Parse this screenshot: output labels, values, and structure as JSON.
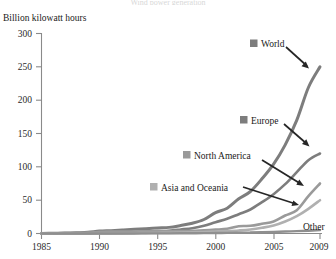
{
  "figure": {
    "cut_off_header": "Wind power generation",
    "yaxis_title": "Billion kilowatt hours"
  },
  "axes": {
    "y_ticks": [
      "0",
      "50",
      "100",
      "150",
      "200",
      "250",
      "300"
    ],
    "x_ticks": [
      "1985",
      "1990",
      "1995",
      "2000",
      "2005",
      "2009"
    ]
  },
  "annotations": [
    {
      "label": "World",
      "swatch": true,
      "color": "#7d7d7d"
    },
    {
      "label": "Europe",
      "swatch": true,
      "color": "#7d7d7d"
    },
    {
      "label": "North America",
      "swatch": true,
      "color": "#9a9a9a"
    },
    {
      "label": "Asia and Oceania",
      "swatch": true,
      "color": "#b0b0b0"
    },
    {
      "label": "Other",
      "swatch": false,
      "color": "#8f8f8f"
    }
  ],
  "chart_data": {
    "type": "line",
    "title": "Wind power generation",
    "xlabel": "",
    "ylabel": "Billion kilowatt hours",
    "xlim": [
      1985,
      2009
    ],
    "ylim": [
      0,
      300
    ],
    "grid": false,
    "legend": "annotated-labels-with-arrows",
    "x": [
      1985,
      1986,
      1987,
      1988,
      1989,
      1990,
      1991,
      1992,
      1993,
      1994,
      1995,
      1996,
      1997,
      1998,
      1999,
      2000,
      2001,
      2002,
      2003,
      2004,
      2005,
      2006,
      2007,
      2008,
      2009
    ],
    "series": [
      {
        "name": "World",
        "color": "#7d7d7d",
        "end_value": 250,
        "values": [
          0.005,
          0.3,
          0.6,
          1.1,
          1.8,
          3.6,
          4.3,
          5.2,
          6.2,
          7.3,
          8.4,
          9.2,
          12.0,
          15.4,
          21.0,
          31.4,
          38.0,
          52.0,
          63.0,
          82.0,
          104.0,
          133.0,
          170.0,
          219.0,
          250.0
        ]
      },
      {
        "name": "Europe",
        "color": "#7d7d7d",
        "end_value": 120,
        "values": [
          0.0,
          0.0,
          0.0,
          0.1,
          0.2,
          0.8,
          1.0,
          1.3,
          1.8,
          2.5,
          3.5,
          4.2,
          6.0,
          8.0,
          11.5,
          17.0,
          22.0,
          29.0,
          36.0,
          47.0,
          59.0,
          74.0,
          92.0,
          110.0,
          120.0
        ]
      },
      {
        "name": "North America",
        "color": "#9a9a9a",
        "end_value": 75,
        "values": [
          0.005,
          0.3,
          0.6,
          1.0,
          1.5,
          2.5,
          2.8,
          3.0,
          3.1,
          3.4,
          3.4,
          3.5,
          3.5,
          3.7,
          4.8,
          5.8,
          7.0,
          11.0,
          11.5,
          14.5,
          18.0,
          27.0,
          35.0,
          56.0,
          75.0
        ]
      },
      {
        "name": "Asia and Oceania",
        "color": "#b0b0b0",
        "end_value": 50,
        "values": [
          0.0,
          0.0,
          0.0,
          0.0,
          0.05,
          0.1,
          0.15,
          0.25,
          0.4,
          0.6,
          0.8,
          1.0,
          1.3,
          1.7,
          2.2,
          2.8,
          3.6,
          4.6,
          6.0,
          8.5,
          12.0,
          18.0,
          26.0,
          37.0,
          50.0
        ]
      },
      {
        "name": "Other",
        "color": "#8f8f8f",
        "end_value": 5,
        "values": [
          0.0,
          0.0,
          0.0,
          0.0,
          0.0,
          0.05,
          0.05,
          0.08,
          0.1,
          0.15,
          0.2,
          0.25,
          0.3,
          0.4,
          0.5,
          0.7,
          0.9,
          1.1,
          1.4,
          1.8,
          2.3,
          2.9,
          3.5,
          4.2,
          5.0
        ]
      }
    ]
  }
}
